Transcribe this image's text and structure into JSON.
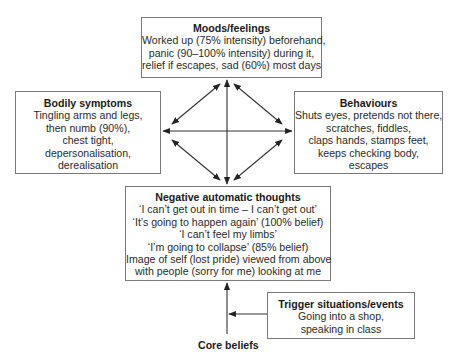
{
  "diagram": {
    "moods": {
      "title": "Moods/feelings",
      "lines": [
        "Worked up (75% intensity) beforehand,",
        "panic (90–100% intensity) during it,",
        "relief if escapes, sad (60%) most days"
      ]
    },
    "bodily": {
      "title": "Bodily symptoms",
      "lines": [
        "Tingling arms and legs,",
        "then numb (90%),",
        "chest tight,",
        "depersonalisation,",
        "derealisation"
      ]
    },
    "behaviours": {
      "title": "Behaviours",
      "lines": [
        "Shuts eyes, pretends not there,",
        "scratches, fiddles,",
        "claps hands, stamps feet,",
        "keeps checking body,",
        "escapes"
      ]
    },
    "nat": {
      "title": "Negative automatic thoughts",
      "lines": [
        "‘I can’t get out in time – I can’t get out’",
        "‘It’s going to happen again’ (100% belief)",
        "‘I can’t feel my limbs’",
        "‘I’m going to collapse’ (85% belief)",
        "Image of self (lost pride) viewed from above",
        "with people (sorry for me) looking at me"
      ]
    },
    "trigger": {
      "title": "Trigger situations/events",
      "lines": [
        "Going into a shop,",
        "speaking in class"
      ]
    },
    "core_beliefs": "Core beliefs",
    "connections": [
      {
        "from": "moods",
        "to": "nat",
        "type": "bidirectional"
      },
      {
        "from": "bodily",
        "to": "behaviours",
        "type": "bidirectional"
      },
      {
        "from": "moods",
        "to": "bodily",
        "type": "bidirectional"
      },
      {
        "from": "moods",
        "to": "behaviours",
        "type": "bidirectional"
      },
      {
        "from": "nat",
        "to": "bodily",
        "type": "bidirectional"
      },
      {
        "from": "nat",
        "to": "behaviours",
        "type": "bidirectional"
      },
      {
        "from": "core_beliefs",
        "to": "nat",
        "type": "directed"
      },
      {
        "from": "trigger",
        "to": "core_beliefs_line",
        "type": "directed"
      }
    ],
    "colors": {
      "border": "#7a7a7a",
      "arrow": "#222222",
      "text": "#2a2a2a"
    }
  }
}
